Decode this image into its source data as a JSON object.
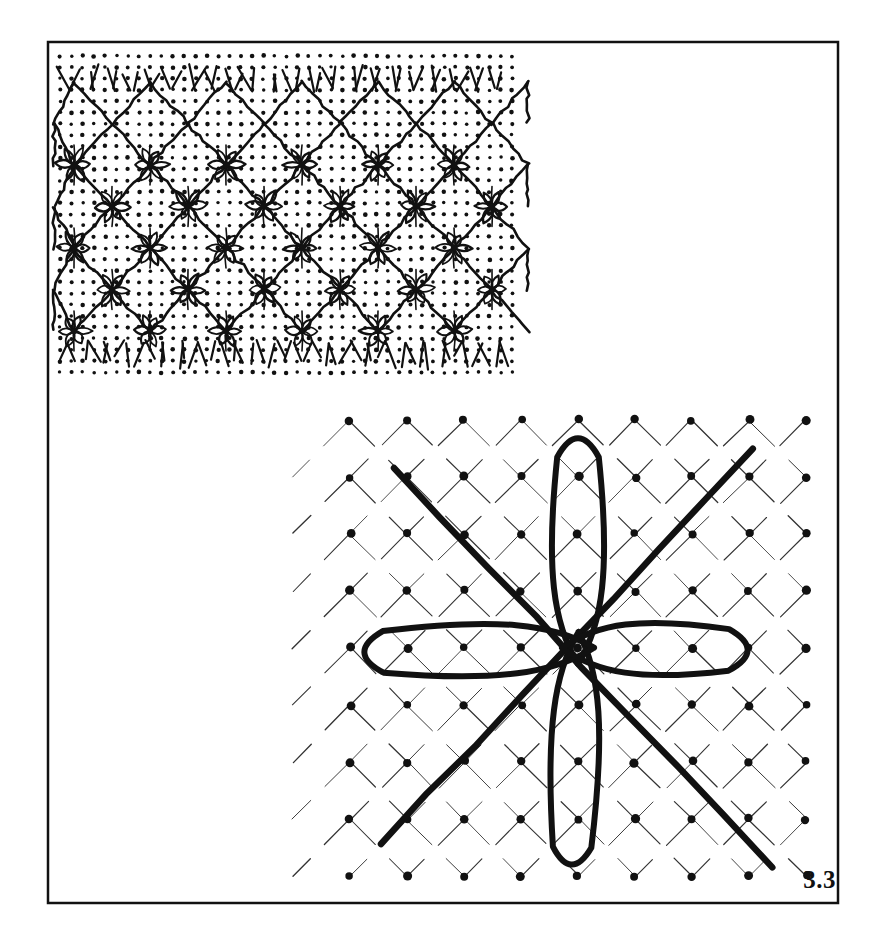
{
  "figure": {
    "label": "3.3",
    "caption_number": "3.3",
    "background_color": "#ffffff",
    "ink_color": "#111111",
    "frame": {
      "name": "outer-plate-border",
      "x": 48,
      "y": 42,
      "width": 790,
      "height": 861,
      "stroke_width": 2.5,
      "stroke_color": "#111111",
      "fill": "#ffffff"
    },
    "panels": [
      {
        "id": "upper-lattice-panel",
        "title": "dotted square lattice with zig-zag diamond traces and six-petal flower motifs",
        "x": 60,
        "y": 56,
        "width": 462,
        "height": 320,
        "dot_grid": {
          "spacing_x": 11.3,
          "spacing_y": 11.3,
          "dot_radius": 2.0,
          "dot_color": "#111111"
        },
        "zigzag": {
          "rows": 3,
          "columns": 6,
          "cell_width": 76,
          "cell_height": 83,
          "stroke_width": 2.6,
          "description": "interlocking V / inverted-V chevrons forming a diamond net"
        },
        "flower_motifs": {
          "count": 22,
          "petals": 6,
          "petal_length": 17,
          "petal_width": 7,
          "stroke_width": 2.0,
          "description": "hand-drawn six-petal rosettes at the lattice nodes"
        },
        "fringe": {
          "top_strokes": 22,
          "bottom_strokes": 24,
          "description": "short broken chevron tick marks along top and bottom of panel"
        }
      },
      {
        "id": "lower-diamond-panel",
        "title": "diamond net of fine dash-dot lines with two heavy diagonals and four bold lobes",
        "center_x": 578,
        "center_y": 648,
        "x": 330,
        "y": 370,
        "width": 500,
        "height": 520,
        "lattice": {
          "spacing": 57,
          "angle_degrees": 45,
          "dot_radius": 4.2,
          "thin_stroke_width": 1.1,
          "thin_stroke_color": "#333333",
          "dash_pattern": "36 20"
        },
        "heavy_diagonals": [
          {
            "name": "heavy-diagonal-nw-se",
            "x1": 394,
            "y1": 468,
            "x2": 772,
            "y2": 866,
            "stroke_width": 6.5
          },
          {
            "name": "heavy-diagonal-sw-ne",
            "x1": 381,
            "y1": 844,
            "x2": 752,
            "y2": 450,
            "stroke_width": 6.5
          }
        ],
        "lobes": [
          {
            "name": "lobe-up",
            "direction": "up",
            "tip_x": 578,
            "tip_y": 452,
            "length": 200,
            "half_width": 26,
            "stroke_width": 6.0
          },
          {
            "name": "lobe-down",
            "direction": "down",
            "tip_x": 572,
            "tip_y": 852,
            "length": 208,
            "half_width": 24,
            "stroke_width": 6.0
          },
          {
            "name": "lobe-left",
            "direction": "left",
            "tip_x": 378,
            "tip_y": 652,
            "length": 198,
            "half_width": 26,
            "stroke_width": 6.0
          },
          {
            "name": "lobe-right",
            "direction": "right",
            "tip_x": 734,
            "tip_y": 650,
            "length": 190,
            "half_width": 26,
            "stroke_width": 6.0
          }
        ]
      }
    ]
  },
  "chart_data": {
    "type": "diagram",
    "title": "3.3",
    "panels": [
      "upper-lattice-panel",
      "lower-diamond-panel"
    ]
  }
}
